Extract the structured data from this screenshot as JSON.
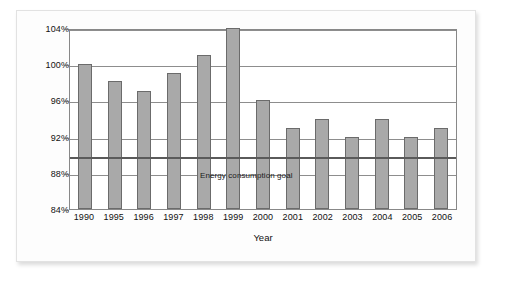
{
  "chart_data": {
    "type": "bar",
    "title": "",
    "xlabel": "Year",
    "ylabel": "",
    "categories": [
      "1990",
      "1995",
      "1996",
      "1997",
      "1998",
      "1999",
      "2000",
      "2001",
      "2002",
      "2003",
      "2004",
      "2005",
      "2006"
    ],
    "values": [
      100,
      98.1,
      97,
      99,
      101,
      104,
      96,
      93,
      94,
      92,
      94,
      92,
      93
    ],
    "unit": "%",
    "ylim": [
      84,
      104
    ],
    "yticks": [
      "84%",
      "88%",
      "92%",
      "96%",
      "100%",
      "104%"
    ],
    "ytick_values": [
      84,
      88,
      92,
      96,
      100,
      104
    ],
    "grid": true,
    "legend": "none",
    "annotations": [
      {
        "name": "goal-line",
        "label": "Energy consumption goal",
        "value": 90,
        "type": "horizontal-line"
      }
    ],
    "colors": {
      "bar_fill": "#a9a9a9",
      "bar_border": "#6b6b6b",
      "gridline": "#8d8d8d",
      "goal_line": "#5a5a5a",
      "plot_background": "#ffffff",
      "figure_background": "#fdfdfd",
      "figure_border": "#e2e2e2",
      "text": "#111111"
    }
  }
}
